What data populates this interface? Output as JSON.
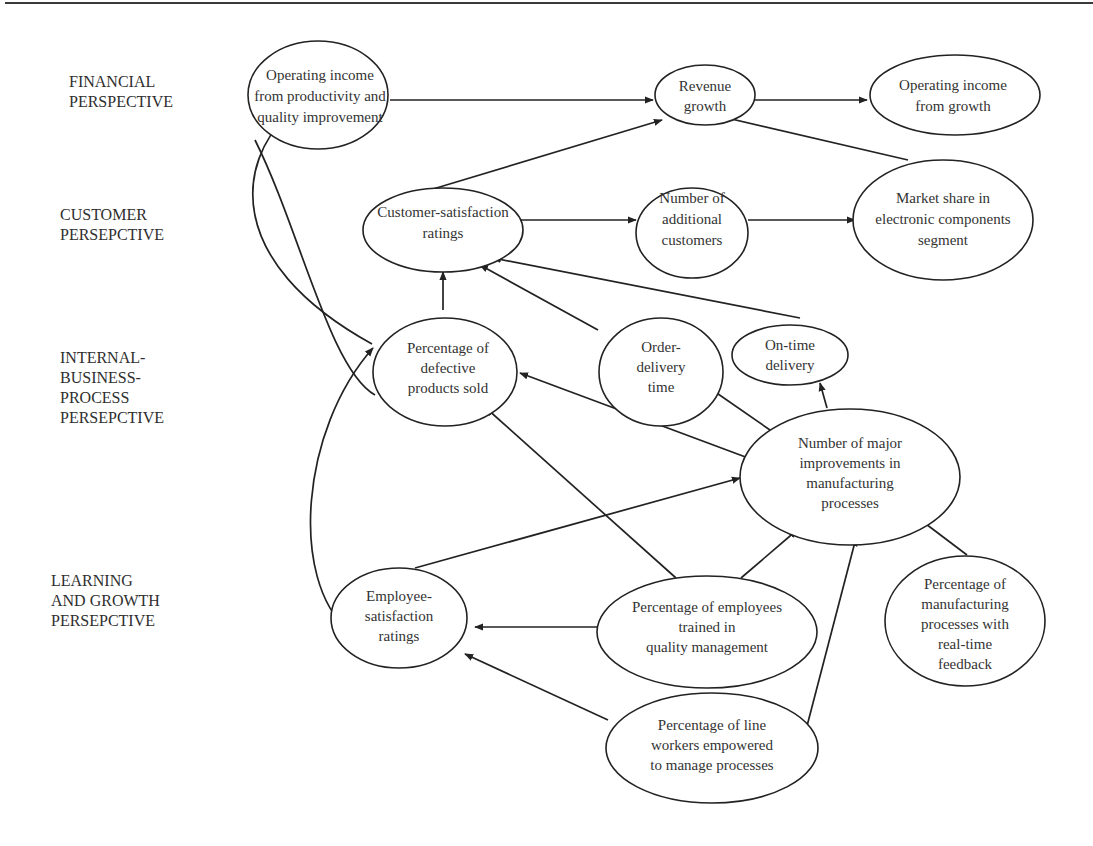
{
  "diagram": {
    "type": "strategy-map",
    "perspectives": [
      {
        "id": "financial",
        "label": "FINANCIAL\nPERSPECTIVE"
      },
      {
        "id": "customer",
        "label": "CUSTOMER\nPERSEPCTIVE"
      },
      {
        "id": "internal",
        "label": "INTERNAL-\nBUSINESS-\nPROCESS\nPERSEPCTIVE"
      },
      {
        "id": "learning",
        "label": "LEARNING\nAND GROWTH\nPERSEPCTIVE"
      }
    ],
    "nodes": [
      {
        "id": "op_income_productivity",
        "perspective": "financial",
        "lines": [
          "Operating income",
          "from productivity and",
          "quality improvement"
        ]
      },
      {
        "id": "revenue_growth",
        "perspective": "financial",
        "lines": [
          "Revenue",
          "growth"
        ]
      },
      {
        "id": "op_income_growth",
        "perspective": "financial",
        "lines": [
          "Operating income",
          "from growth"
        ]
      },
      {
        "id": "customer_satisfaction",
        "perspective": "customer",
        "lines": [
          "Customer-satisfaction",
          "ratings"
        ]
      },
      {
        "id": "additional_customers",
        "perspective": "customer",
        "lines": [
          "Number of",
          "additional",
          "customers"
        ]
      },
      {
        "id": "market_share",
        "perspective": "customer",
        "lines": [
          "Market share in",
          "electronic components",
          "segment"
        ]
      },
      {
        "id": "defective_products",
        "perspective": "internal",
        "lines": [
          "Percentage of",
          "defective",
          "products sold"
        ]
      },
      {
        "id": "order_delivery_time",
        "perspective": "internal",
        "lines": [
          "Order-",
          "delivery",
          "time"
        ]
      },
      {
        "id": "on_time_delivery",
        "perspective": "internal",
        "lines": [
          "On-time",
          "delivery"
        ]
      },
      {
        "id": "major_improvements",
        "perspective": "internal",
        "lines": [
          "Number of major",
          "improvements in",
          "manufacturing",
          "processes"
        ]
      },
      {
        "id": "employee_satisfaction",
        "perspective": "learning",
        "lines": [
          "Employee-",
          "satisfaction",
          "ratings"
        ]
      },
      {
        "id": "employees_trained",
        "perspective": "learning",
        "lines": [
          "Percentage of employees",
          "trained in",
          "quality management"
        ]
      },
      {
        "id": "realtime_feedback",
        "perspective": "learning",
        "lines": [
          "Percentage of",
          "manufacturing",
          "processes with",
          "real-time",
          "feedback"
        ]
      },
      {
        "id": "line_workers_empowered",
        "perspective": "learning",
        "lines": [
          "Percentage of line",
          "workers empowered",
          "to manage processes"
        ]
      }
    ],
    "edges": [
      {
        "from": "op_income_productivity",
        "to": "revenue_growth"
      },
      {
        "from": "revenue_growth",
        "to": "op_income_growth"
      },
      {
        "from": "customer_satisfaction",
        "to": "revenue_growth"
      },
      {
        "from": "market_share",
        "to": "revenue_growth"
      },
      {
        "from": "customer_satisfaction",
        "to": "additional_customers"
      },
      {
        "from": "additional_customers",
        "to": "market_share"
      },
      {
        "from": "defective_products",
        "to": "customer_satisfaction"
      },
      {
        "from": "order_delivery_time",
        "to": "customer_satisfaction"
      },
      {
        "from": "on_time_delivery",
        "to": "customer_satisfaction"
      },
      {
        "from": "defective_products",
        "to": "op_income_productivity"
      },
      {
        "from": "major_improvements",
        "to": "defective_products"
      },
      {
        "from": "major_improvements",
        "to": "order_delivery_time"
      },
      {
        "from": "major_improvements",
        "to": "on_time_delivery"
      },
      {
        "from": "employee_satisfaction",
        "to": "defective_products"
      },
      {
        "from": "employee_satisfaction",
        "to": "major_improvements"
      },
      {
        "from": "employees_trained",
        "to": "defective_products"
      },
      {
        "from": "employees_trained",
        "to": "major_improvements"
      },
      {
        "from": "employees_trained",
        "to": "employee_satisfaction"
      },
      {
        "from": "realtime_feedback",
        "to": "major_improvements"
      },
      {
        "from": "line_workers_empowered",
        "to": "employee_satisfaction"
      },
      {
        "from": "line_workers_empowered",
        "to": "major_improvements"
      }
    ]
  }
}
